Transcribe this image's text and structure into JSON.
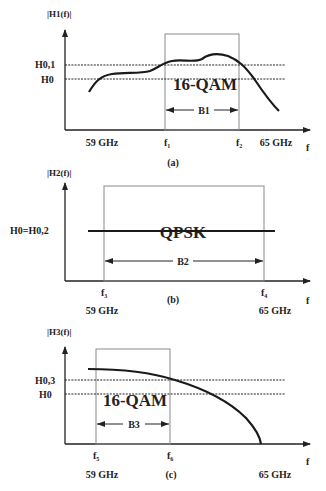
{
  "colors": {
    "ink": "#222222",
    "box": "#8a8a8a",
    "curve": "#1a1a1a",
    "background": "#ffffff"
  },
  "panels": [
    {
      "id": "a",
      "caption": "(a)",
      "y_axis_label": "|H1(f)|",
      "x_axis_label": "f",
      "levels": [
        {
          "label": "H0,1",
          "y": 65
        },
        {
          "label": "H0",
          "y": 79
        }
      ],
      "modulation": "16-QAM",
      "band": {
        "label": "B1",
        "start_label": "f",
        "start_sub": "1",
        "end_label": "f",
        "end_sub": "2"
      },
      "freq_labels": {
        "low": "59 GHz",
        "high": "65 GHz"
      }
    },
    {
      "id": "b",
      "caption": "(b)",
      "y_axis_label": "|H2(f)|",
      "x_axis_label": "f",
      "levels": [
        {
          "label": "H0=H0,2",
          "y": 231
        }
      ],
      "modulation": "QPSK",
      "band": {
        "label": "B2",
        "start_label": "f",
        "start_sub": "3",
        "end_label": "f",
        "end_sub": "4"
      },
      "freq_labels": {
        "low": "59 GHz",
        "high": "65 GHz"
      }
    },
    {
      "id": "c",
      "caption": "(c)",
      "y_axis_label": "|H3(f)|",
      "x_axis_label": "f",
      "levels": [
        {
          "label": "H0,3",
          "y": 380
        },
        {
          "label": "H0",
          "y": 394
        }
      ],
      "modulation": "16-QAM",
      "band": {
        "label": "B3",
        "start_label": "f",
        "start_sub": "5",
        "end_label": "f",
        "end_sub": "6"
      },
      "freq_labels": {
        "low": "59 GHz",
        "high": "65 GHz"
      }
    }
  ],
  "curves": {
    "h1": "M89,92 C95,82 100,76 112,74 C125,72 140,74 150,71 C158,68 162,63 172,61 C182,59 195,63 202,59 C210,53 218,53 228,56 C238,60 245,66 255,80 C263,92 272,104 279,111",
    "h2": "M88,231 L275,231",
    "h3": "M88,369 C120,369 150,372 175,380 C205,389 230,402 246,418 C255,428 260,436 261,444"
  }
}
